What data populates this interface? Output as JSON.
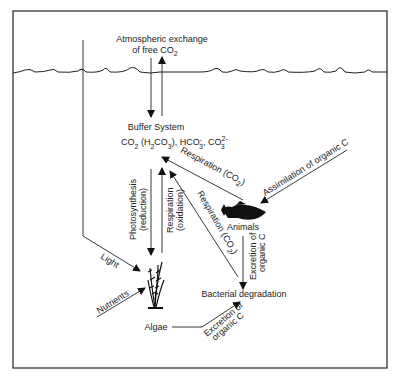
{
  "diagram": {
    "atmosphere_label_line1": "Atmospheric exchange",
    "atmosphere_label_line2": "of free CO",
    "atmosphere_label_sub": "2",
    "buffer_title": "Buffer System",
    "buffer_formula": {
      "co2": "CO",
      "co2_sub": "2",
      "h2co3_open": " (H",
      "h2co3_sub1": "2",
      "h2co3_mid": "CO",
      "h2co3_sub2": "3",
      "h2co3_close": "), HCO",
      "hco3_sup": "-",
      "hco3_sub": "3",
      "co3": ", CO",
      "co3_sup": "2-",
      "co3_sub": "3"
    },
    "nodes": {
      "animals": "Animals",
      "algae": "Algae",
      "bacteria": "Bacterial degradation"
    },
    "edges": {
      "respiration_animals": "Respiration (CO",
      "respiration_animals_sub": "2",
      "assimilation": "Assimilation of organic C",
      "photosynthesis_line1": "Photosynthesis",
      "photosynthesis_line2": "(reduction)",
      "respiration_algae_line1": "Respiration",
      "respiration_algae_line2": "(oxidation)",
      "respiration_bacteria": "Respiration (CO",
      "respiration_bacteria_sub": "2",
      "excretion_animals_line1": "Excretion of",
      "excretion_animals_line2": "organic C",
      "excretion_algae_line1": "Excretion of",
      "excretion_algae_line2": "organic C",
      "light": "Light",
      "nutrients": "Nutrients"
    },
    "colors": {
      "line": "#222222",
      "background": "#ffffff"
    }
  }
}
